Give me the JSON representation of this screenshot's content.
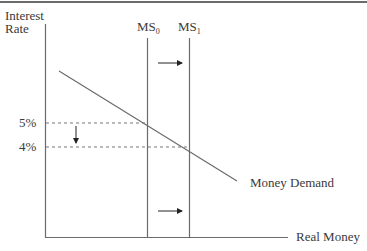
{
  "diagram": {
    "title": "",
    "y_axis_label_line1": "Interest",
    "y_axis_label_line2": "Rate",
    "x_axis_label": "Real Money",
    "supply_curves": [
      {
        "name": "MS",
        "subscript": "0"
      },
      {
        "name": "MS",
        "subscript": "1"
      }
    ],
    "demand_curve_label": "Money Demand",
    "rate_levels": [
      {
        "label": "5%",
        "value": 5
      },
      {
        "label": "4%",
        "value": 4
      }
    ],
    "annotations": [
      "Arrow right between MS0 and MS1 (upper)",
      "Arrow right between MS0 and MS1 (lower)",
      "Arrow down from 5% to 4%"
    ],
    "colors": {
      "line": "#6b6b6b",
      "text": "#3a3a3a",
      "arrow": "#222222"
    }
  }
}
